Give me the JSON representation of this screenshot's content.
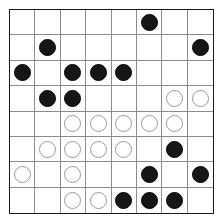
{
  "board": {
    "title": "Othello/Reversi board position",
    "rows": 8,
    "columns": 8,
    "colors": {
      "black_piece": "#161616",
      "white_piece": "#ffffff",
      "white_piece_outline": "#9a9a9a",
      "grid_line": "#8c8c8c",
      "border": "#1a1a1a",
      "background": "#ffffff"
    },
    "legend": {
      "black": "black-disc",
      "white": "white-disc",
      "empty": "empty-cell"
    },
    "cells": [
      [
        "empty",
        "empty",
        "empty",
        "empty",
        "empty",
        "black",
        "empty",
        "empty"
      ],
      [
        "empty",
        "black",
        "empty",
        "empty",
        "empty",
        "empty",
        "empty",
        "black"
      ],
      [
        "black",
        "empty",
        "black",
        "black",
        "black",
        "empty",
        "empty",
        "empty"
      ],
      [
        "empty",
        "black",
        "black",
        "empty",
        "empty",
        "empty",
        "white",
        "white"
      ],
      [
        "empty",
        "empty",
        "white",
        "white",
        "white",
        "white",
        "white",
        "empty"
      ],
      [
        "empty",
        "white",
        "white",
        "white",
        "white",
        "empty",
        "black",
        "empty"
      ],
      [
        "white",
        "empty",
        "white",
        "empty",
        "empty",
        "black",
        "empty",
        "black"
      ],
      [
        "empty",
        "empty",
        "white",
        "white",
        "black",
        "black",
        "black",
        "empty"
      ]
    ],
    "counts": {
      "black": 17,
      "white": 14,
      "empty": 33
    }
  }
}
